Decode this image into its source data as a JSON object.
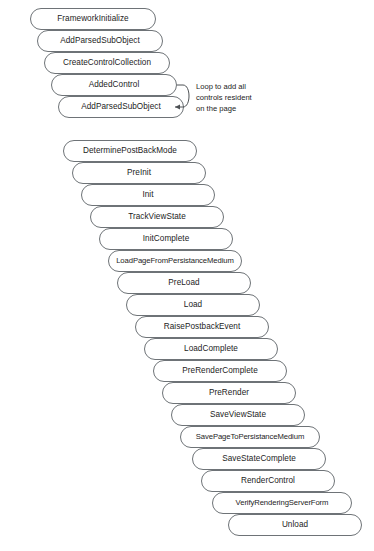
{
  "diagram": {
    "style": {
      "box_border_color": "#6e7377",
      "box_fill_color": "#ffffff",
      "text_color": "#1c1c1c",
      "background_color": "#ffffff"
    },
    "groups": [
      {
        "name": "control-initialization-group",
        "stages": [
          {
            "label": "FrameworkInitialize"
          },
          {
            "label": "AddParsedSubObject"
          },
          {
            "label": "CreateControlCollection"
          },
          {
            "label": "AddedControl"
          },
          {
            "label": "AddParsedSubObject"
          }
        ]
      },
      {
        "name": "page-lifecycle-group",
        "stages": [
          {
            "label": "DeterminePostBackMode"
          },
          {
            "label": "PreInit"
          },
          {
            "label": "Init"
          },
          {
            "label": "TrackViewState"
          },
          {
            "label": "InitComplete"
          },
          {
            "label": "LoadPageFromPersistanceMedium"
          },
          {
            "label": "PreLoad"
          },
          {
            "label": "Load"
          },
          {
            "label": "RaisePostbackEvent"
          },
          {
            "label": "LoadComplete"
          },
          {
            "label": "PreRenderComplete"
          },
          {
            "label": "PreRender"
          },
          {
            "label": "SaveViewState"
          },
          {
            "label": "SavePageToPersistanceMedium"
          },
          {
            "label": "SaveStateComplete"
          },
          {
            "label": "RenderControl"
          },
          {
            "label": "VerifyRenderingServerForm"
          },
          {
            "label": "Unload"
          }
        ]
      }
    ],
    "annotations": {
      "loop_note": {
        "line1": "Loop to add all",
        "line2": "controls resident",
        "line3": "on the page"
      }
    }
  }
}
